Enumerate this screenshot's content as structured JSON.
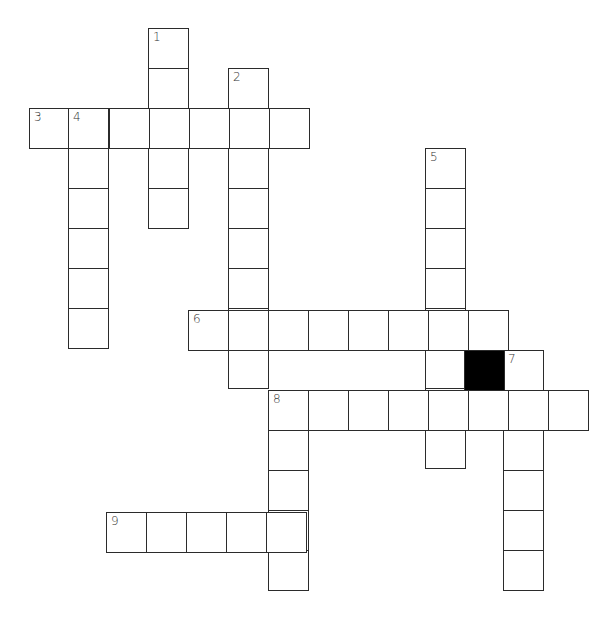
{
  "puzzle": {
    "type": "crossword",
    "cell_size": 40,
    "colors": {
      "line": "#2b2b2b",
      "block": "#000000",
      "background": "#ffffff"
    },
    "clue_numbers": [
      "1",
      "2",
      "3",
      "4",
      "5",
      "6",
      "7",
      "8",
      "9"
    ],
    "words": [
      {
        "number": "1",
        "direction": "down",
        "x": 148,
        "y": 28,
        "length": 5
      },
      {
        "number": "2",
        "direction": "down",
        "x": 228,
        "y": 68,
        "length": 8
      },
      {
        "number": "3",
        "direction": "across",
        "x": 29,
        "y": 108,
        "length": 7
      },
      {
        "number": "4",
        "direction": "down",
        "x": 68,
        "y": 108,
        "length": 6
      },
      {
        "number": "5",
        "direction": "down",
        "x": 425,
        "y": 148,
        "length": 8
      },
      {
        "number": "6",
        "direction": "across",
        "x": 188,
        "y": 310,
        "length": 8
      },
      {
        "number": "7",
        "direction": "down",
        "x": 503,
        "y": 350,
        "length": 6
      },
      {
        "number": "8",
        "direction": "across",
        "x": 268,
        "y": 390,
        "length": 8
      },
      {
        "number": "8",
        "direction": "down",
        "x": 268,
        "y": 390,
        "length": 5
      },
      {
        "number": "9",
        "direction": "across",
        "x": 106,
        "y": 512,
        "length": 5
      }
    ],
    "black_cells": [
      {
        "x": 464,
        "y": 350
      }
    ]
  }
}
